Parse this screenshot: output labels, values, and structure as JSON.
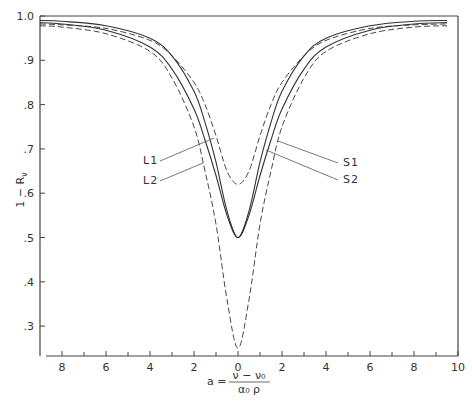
{
  "chart_data": {
    "type": "line",
    "title": "",
    "xlabel": "a = (ν − ν₀) / (α₀ ρ)",
    "ylabel": "1 − R_ν",
    "xlim": [
      -9,
      10
    ],
    "ylim": [
      0.22,
      1.0
    ],
    "x_ticks": [
      -8,
      -6,
      -4,
      -2,
      0,
      2,
      4,
      6,
      8,
      10
    ],
    "x_tick_labels": [
      "8",
      "6",
      "4",
      "2",
      "0",
      "2",
      "4",
      "6",
      "8",
      "10"
    ],
    "y_ticks": [
      1.0,
      0.9,
      0.8,
      0.7,
      0.6,
      0.5,
      0.4,
      0.3
    ],
    "y_tick_labels": [
      "1.0",
      ".9",
      ".8",
      ".7",
      ".6",
      ".5",
      ".4",
      ".3"
    ],
    "grid": false,
    "legend": "none (curves labeled by leader lines)",
    "x": [
      -9,
      -8,
      -6,
      -4,
      -3,
      -2,
      -1.5,
      -1,
      -0.5,
      0,
      0.5,
      1,
      1.5,
      2,
      3,
      4,
      6,
      8,
      9.5
    ],
    "series": [
      {
        "name": "L1",
        "style": "solid",
        "values": [
          0.985,
          0.982,
          0.968,
          0.93,
          0.88,
          0.79,
          0.72,
          0.64,
          0.55,
          0.5,
          0.55,
          0.64,
          0.72,
          0.79,
          0.88,
          0.93,
          0.968,
          0.982,
          0.985
        ]
      },
      {
        "name": "S1",
        "style": "solid",
        "values": [
          0.99,
          0.988,
          0.978,
          0.95,
          0.91,
          0.83,
          0.76,
          0.67,
          0.56,
          0.5,
          0.56,
          0.67,
          0.76,
          0.83,
          0.91,
          0.95,
          0.978,
          0.988,
          0.99
        ]
      },
      {
        "name": "L2",
        "style": "dashed",
        "values": [
          0.978,
          0.975,
          0.96,
          0.92,
          0.86,
          0.75,
          0.65,
          0.53,
          0.36,
          0.25,
          0.36,
          0.53,
          0.65,
          0.75,
          0.86,
          0.92,
          0.96,
          0.975,
          0.978
        ]
      },
      {
        "name": "S2",
        "style": "dashed",
        "values": [
          0.982,
          0.98,
          0.972,
          0.945,
          0.91,
          0.85,
          0.8,
          0.73,
          0.65,
          0.62,
          0.65,
          0.73,
          0.8,
          0.85,
          0.91,
          0.945,
          0.972,
          0.98,
          0.982
        ]
      }
    ],
    "annotations": [
      "L1",
      "L2",
      "S1",
      "S2"
    ]
  },
  "axis": {
    "ylabel": "1 − R",
    "ylabel_sub": "ν",
    "xlabel_lhs": "a =",
    "xlabel_num": "ν − ν₀",
    "xlabel_den": "α₀ ρ"
  },
  "labels": {
    "L1": "L1",
    "L2": "L2",
    "S1": "S1",
    "S2": "S2"
  },
  "colors": {
    "line": "#333333",
    "axis": "#444444",
    "background": "#ffffff"
  }
}
